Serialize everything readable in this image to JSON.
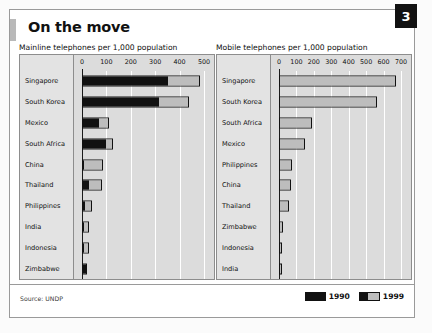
{
  "badge": {
    "number": "3"
  },
  "header": {
    "title": "On the move"
  },
  "footer": {
    "source": "Source: UNDP",
    "legend": [
      {
        "label": "1990",
        "color": "#111111",
        "type": "solid"
      },
      {
        "label": "1999",
        "color": "#bdbdbd",
        "type": "split"
      }
    ]
  },
  "chart_data": [
    {
      "type": "bar",
      "orientation": "horizontal",
      "stacked": true,
      "title": "Mainline telephones per 1,000 population",
      "xlabel": "",
      "ylabel": "",
      "xlim": [
        0,
        500
      ],
      "ticks": [
        0,
        100,
        200,
        300,
        400,
        500
      ],
      "tick_labels": [
        "0",
        "100",
        "200",
        "300",
        "400",
        "500"
      ],
      "grid": true,
      "legend_position": "bottom-right",
      "categories": [
        "Singapore",
        "South Korea",
        "Mexico",
        "South Africa",
        "China",
        "Thailand",
        "Philippines",
        "India",
        "Indonesia",
        "Zimbabwe"
      ],
      "series": [
        {
          "name": "1990",
          "color": "#111111",
          "values": [
            350,
            310,
            65,
            93,
            6,
            24,
            10,
            6,
            6,
            12
          ]
        },
        {
          "name": "1999",
          "color": "#bdbdbd",
          "values": [
            482,
            438,
            112,
            125,
            86,
            84,
            39,
            27,
            29,
            19
          ]
        }
      ]
    },
    {
      "type": "bar",
      "orientation": "horizontal",
      "stacked": true,
      "title": "Mobile telephones per 1,000 population",
      "xlabel": "",
      "ylabel": "",
      "xlim": [
        0,
        700
      ],
      "ticks": [
        0,
        100,
        200,
        300,
        400,
        500,
        600,
        700
      ],
      "tick_labels": [
        "0",
        "100",
        "200",
        "300",
        "400",
        "500",
        "600",
        "700"
      ],
      "grid": true,
      "legend_position": "bottom-right",
      "categories": [
        "Singapore",
        "South Korea",
        "South Africa",
        "Mexico",
        "Philippines",
        "China",
        "Thailand",
        "Zimbabwe",
        "Indonesia",
        "India"
      ],
      "series": [
        {
          "name": "1990",
          "color": "#111111",
          "values": [
            0,
            0,
            0,
            0,
            0,
            0,
            0,
            0,
            0,
            0
          ]
        },
        {
          "name": "1999",
          "color": "#bdbdbd",
          "values": [
            674,
            560,
            190,
            152,
            76,
            70,
            56,
            25,
            19,
            5
          ]
        }
      ]
    }
  ]
}
